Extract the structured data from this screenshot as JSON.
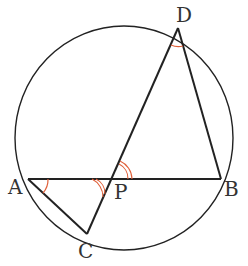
{
  "diagram": {
    "type": "circle-geometry",
    "circle": {
      "cx": 124,
      "cy": 138,
      "r": 110
    },
    "points": {
      "A": {
        "x": 28,
        "y": 179,
        "label": "A"
      },
      "B": {
        "x": 221,
        "y": 179,
        "label": "B"
      },
      "C": {
        "x": 87,
        "y": 234,
        "label": "C"
      },
      "D": {
        "x": 178,
        "y": 28,
        "label": "D"
      },
      "P": {
        "x": 112,
        "y": 179,
        "label": "P"
      }
    },
    "segments": [
      "AB",
      "AC",
      "CD",
      "DB"
    ],
    "angle_marks": [
      {
        "at": "A",
        "between": [
          "B",
          "C"
        ],
        "arcs": 1
      },
      {
        "at": "D",
        "between": [
          "C",
          "B"
        ],
        "arcs": 1
      },
      {
        "at": "P",
        "between": [
          "A",
          "C"
        ],
        "arcs": 2
      },
      {
        "at": "P",
        "between": [
          "B",
          "D"
        ],
        "arcs": 2
      }
    ],
    "colors": {
      "line": "#222222",
      "angle_mark": "#e0603a",
      "label": "#333333"
    }
  }
}
